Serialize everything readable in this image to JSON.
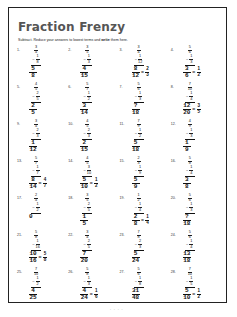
{
  "worksheet": {
    "title": "Fraction Frenzy",
    "instructions_prefix": "Subtract. Reduce your answers to lowest terms and ",
    "instructions_bold": "write",
    "instructions_suffix": " them here.",
    "footer": "- - - -"
  },
  "problems": [
    {
      "n": "1.",
      "top": [
        "3",
        "4"
      ],
      "bottom": [
        "1",
        "8"
      ],
      "ans": [
        "5",
        "8"
      ],
      "simp": null
    },
    {
      "n": "2.",
      "top": [
        "3",
        "5"
      ],
      "bottom": [
        "1",
        "3"
      ],
      "ans": [
        "4",
        "15"
      ],
      "simp": null
    },
    {
      "n": "3.",
      "top": [
        "3",
        "4"
      ],
      "bottom": [
        "1",
        "12"
      ],
      "ans": [
        "8",
        "12"
      ],
      "simp": [
        "2",
        "3"
      ]
    },
    {
      "n": "4.",
      "top": [
        "5",
        "6"
      ],
      "bottom": [
        "1",
        "3"
      ],
      "ans": [
        "3",
        "6"
      ],
      "simp": [
        "1",
        "2"
      ]
    },
    {
      "n": "5.",
      "top": [
        "4",
        "5"
      ],
      "bottom": [
        "2",
        "5"
      ],
      "ans": [
        "2",
        "5"
      ],
      "simp": null
    },
    {
      "n": "6.",
      "top": [
        "5",
        "7"
      ],
      "bottom": [
        "1",
        "2"
      ],
      "ans": [
        "3",
        "14"
      ],
      "simp": null
    },
    {
      "n": "7.",
      "top": [
        "5",
        "6"
      ],
      "bottom": [
        "1",
        "3"
      ],
      "ans": [
        "?",
        "18"
      ],
      "simp": null
    },
    {
      "n": "8.",
      "top": [
        "7",
        "10"
      ],
      "bottom": [
        "1",
        "4"
      ],
      "ans": [
        "12",
        "20"
      ],
      "simp": [
        "3",
        "5"
      ]
    },
    {
      "n": "9.",
      "top": [
        "3",
        "4"
      ],
      "bottom": [
        "2",
        "3"
      ],
      "ans": [
        "1",
        "12"
      ],
      "simp": null
    },
    {
      "n": "10.",
      "top": [
        "4",
        "5"
      ],
      "bottom": [
        "2",
        "3"
      ],
      "ans": [
        "2",
        "15"
      ],
      "simp": null
    },
    {
      "n": "11.",
      "top": [
        "7",
        "9"
      ],
      "bottom": [
        "1",
        "2"
      ],
      "ans": [
        "5",
        "18"
      ],
      "simp": null
    },
    {
      "n": "12.",
      "top": [
        "4",
        "9"
      ],
      "bottom": [
        "1",
        "3"
      ],
      "ans": [
        "1",
        "9"
      ],
      "simp": null
    },
    {
      "n": "13.",
      "top": [
        "5",
        "7"
      ],
      "bottom": [
        "1",
        "7"
      ],
      "ans": [
        "8",
        "14"
      ],
      "simp": [
        "4",
        "7"
      ]
    },
    {
      "n": "14.",
      "top": [
        "4",
        "5"
      ],
      "bottom": [
        "3",
        "10"
      ],
      "ans": [
        "5",
        "10"
      ],
      "simp": [
        "1",
        "2"
      ]
    },
    {
      "n": "15.",
      "top": [
        "2",
        "3"
      ],
      "bottom": [
        "1",
        "9"
      ],
      "ans": [
        "5",
        "9"
      ],
      "simp": null
    },
    {
      "n": "16.",
      "top": [
        "5",
        "8"
      ],
      "bottom": [
        "1",
        "4"
      ],
      "ans": [
        "3",
        "8"
      ],
      "simp": null
    },
    {
      "n": "17.",
      "top": [
        "2",
        "4"
      ],
      "bottom": [
        "1",
        "2"
      ],
      "ans": [
        "0",
        ""
      ],
      "simp": null
    },
    {
      "n": "18.",
      "top": [
        "3",
        "5"
      ],
      "bottom": [
        "2",
        "5"
      ],
      "ans": [
        "1",
        "5"
      ],
      "simp": null
    },
    {
      "n": "19.",
      "top": [
        "1",
        "2"
      ],
      "bottom": [
        "1",
        "4"
      ],
      "ans": [
        "2",
        "8"
      ],
      "simp": [
        "1",
        "4"
      ]
    },
    {
      "n": "20.",
      "top": [
        "5",
        "6"
      ],
      "bottom": [
        "1",
        "3"
      ],
      "ans": [
        "?",
        "18"
      ],
      "simp": null
    },
    {
      "n": "21.",
      "top": [
        "5",
        "8"
      ],
      "bottom": [
        "1",
        "16"
      ],
      "ans": [
        "10",
        "16"
      ],
      "simp": [
        "5",
        "8"
      ]
    },
    {
      "n": "22.",
      "top": [
        "3",
        "4"
      ],
      "bottom": [
        "2",
        "5"
      ],
      "ans": [
        "7",
        "20"
      ],
      "simp": null
    },
    {
      "n": "23.",
      "top": [
        "7",
        "8"
      ],
      "bottom": [
        "2",
        "3"
      ],
      "ans": [
        "5",
        "24"
      ],
      "simp": null
    },
    {
      "n": "24.",
      "top": [
        "5",
        "6"
      ],
      "bottom": [
        "1",
        "4"
      ],
      "ans": [
        "13",
        "18"
      ],
      "simp": null
    },
    {
      "n": "25.",
      "top": [
        "7",
        "10"
      ],
      "bottom": [
        "1",
        "2"
      ],
      "ans": [
        "4",
        "25"
      ],
      "simp": null
    },
    {
      "n": "26.",
      "top": [
        "5",
        "8"
      ],
      "bottom": [
        "1",
        "3"
      ],
      "ans": [
        "4",
        "24"
      ],
      "simp": [
        "1",
        "6"
      ]
    },
    {
      "n": "27.",
      "top": [
        "5",
        "6"
      ],
      "bottom": [
        "1",
        "8"
      ],
      "ans": [
        "31",
        "48"
      ],
      "simp": null
    },
    {
      "n": "28.",
      "top": [
        "7",
        "10"
      ],
      "bottom": [
        "1",
        "5"
      ],
      "ans": [
        "5",
        "10"
      ],
      "simp": [
        "1",
        "2"
      ]
    }
  ]
}
